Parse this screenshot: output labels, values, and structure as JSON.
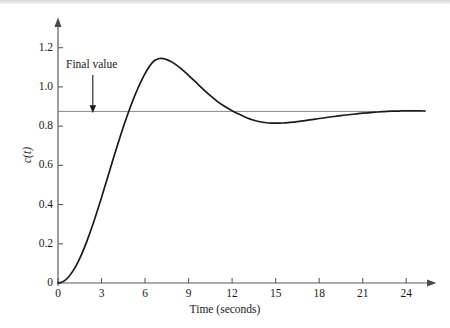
{
  "figure": {
    "background_color": "#ffffff",
    "top_band_color": "#dcdddf",
    "curve_color": "#1a1a1a",
    "axis_color": "#5a5a5a",
    "final_value_line_color": "#8a8a8a"
  },
  "annotations": {
    "final_value_label": "Final value",
    "final_value_arrow": "down-arrow-icon"
  },
  "axes": {
    "x_title": "Time (seconds)",
    "y_title": "c(t)",
    "x_ticks": [
      "0",
      "3",
      "6",
      "9",
      "12",
      "15",
      "18",
      "21",
      "24"
    ],
    "y_ticks": [
      "0",
      "0.2",
      "0.4",
      "0.6",
      "0.8",
      "1.0",
      "1.2"
    ]
  },
  "chart_data": {
    "type": "line",
    "title": "",
    "xlabel": "Time (seconds)",
    "ylabel": "c(t)",
    "xlim": [
      0,
      25.5
    ],
    "ylim": [
      0,
      1.28
    ],
    "grid": false,
    "legend": "none",
    "x_ticks": [
      0,
      3,
      6,
      9,
      12,
      15,
      18,
      21,
      24
    ],
    "y_ticks": [
      0,
      0.2,
      0.4,
      0.6,
      0.8,
      1.0,
      1.2
    ],
    "annotations": [
      {
        "text": "Final value",
        "x": 2.4,
        "y": 1.02,
        "arrow_to_x": 2.4,
        "arrow_to_y": 0.875
      }
    ],
    "reference_lines": [
      {
        "name": "final-value",
        "orientation": "horizontal",
        "y": 0.875,
        "x_start": 0,
        "x_end": 21,
        "color": "#8a8a8a"
      }
    ],
    "features": {
      "final_value": 0.875,
      "peak_value": 1.145,
      "peak_time": 7.1,
      "trough_value": 0.815,
      "trough_time": 14.8,
      "percent_overshoot": 30.9,
      "rise_crossing_time": 4.2
    },
    "series": [
      {
        "name": "c(t)",
        "color": "#1a1a1a",
        "x": [
          0,
          0.25,
          0.5,
          0.75,
          1.0,
          1.25,
          1.5,
          1.75,
          2.0,
          2.25,
          2.5,
          2.75,
          3.0,
          3.25,
          3.5,
          3.75,
          4.0,
          4.25,
          4.5,
          4.75,
          5.0,
          5.25,
          5.5,
          5.75,
          6.0,
          6.25,
          6.5,
          6.75,
          7.0,
          7.25,
          7.5,
          7.75,
          8.0,
          8.5,
          9.0,
          9.5,
          10.0,
          10.5,
          11.0,
          11.5,
          12.0,
          12.5,
          13.0,
          13.5,
          14.0,
          14.5,
          15.0,
          15.5,
          16.0,
          16.5,
          17.0,
          17.5,
          18.0,
          18.5,
          19.0,
          19.5,
          20.0,
          20.5,
          21.0,
          21.5,
          22.0,
          22.5,
          23.0,
          23.5,
          24.0,
          24.5,
          25.0,
          25.3
        ],
        "y": [
          0.0,
          0.004,
          0.015,
          0.033,
          0.058,
          0.089,
          0.126,
          0.168,
          0.215,
          0.266,
          0.32,
          0.377,
          0.436,
          0.497,
          0.558,
          0.619,
          0.679,
          0.738,
          0.795,
          0.849,
          0.9,
          0.948,
          0.992,
          1.032,
          1.068,
          1.099,
          1.124,
          1.138,
          1.145,
          1.144,
          1.139,
          1.131,
          1.12,
          1.092,
          1.059,
          1.024,
          0.989,
          0.955,
          0.925,
          0.9,
          0.879,
          0.86,
          0.843,
          0.83,
          0.821,
          0.816,
          0.815,
          0.816,
          0.819,
          0.823,
          0.828,
          0.833,
          0.839,
          0.844,
          0.849,
          0.854,
          0.858,
          0.862,
          0.866,
          0.869,
          0.872,
          0.874,
          0.876,
          0.877,
          0.878,
          0.878,
          0.878,
          0.877
        ]
      }
    ]
  }
}
